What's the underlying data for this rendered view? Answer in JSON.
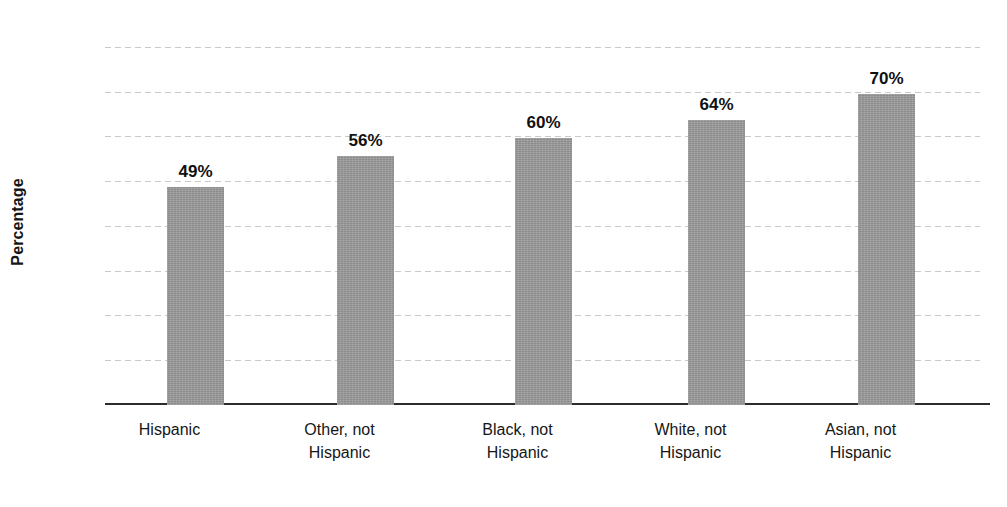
{
  "chart_data": {
    "type": "bar",
    "title": "",
    "xlabel": "",
    "ylabel": "Percentage",
    "ylim": [
      0,
      80
    ],
    "ytick_step": 10,
    "grid": true,
    "legend": "none",
    "bar_color": "#9a9a9a",
    "categories": [
      "Hispanic",
      "Other, not Hispanic",
      "Black, not Hispanic",
      "White, not Hispanic",
      "Asian, not Hispanic"
    ],
    "category_lines": [
      [
        "Hispanic",
        ""
      ],
      [
        "Other, not",
        "Hispanic"
      ],
      [
        "Black, not",
        "Hispanic"
      ],
      [
        "White, not",
        "Hispanic"
      ],
      [
        "Asian, not",
        "Hispanic"
      ]
    ],
    "values": [
      49,
      56,
      60,
      64,
      70
    ],
    "value_labels": [
      "49%",
      "56%",
      "60%",
      "64%",
      "70%"
    ],
    "ytick_labels": [
      "80",
      "70",
      "60",
      "50",
      "40",
      "30",
      "20",
      "10",
      "0"
    ],
    "ytick_values": [
      80,
      70,
      60,
      50,
      40,
      30,
      20,
      10,
      0
    ]
  }
}
